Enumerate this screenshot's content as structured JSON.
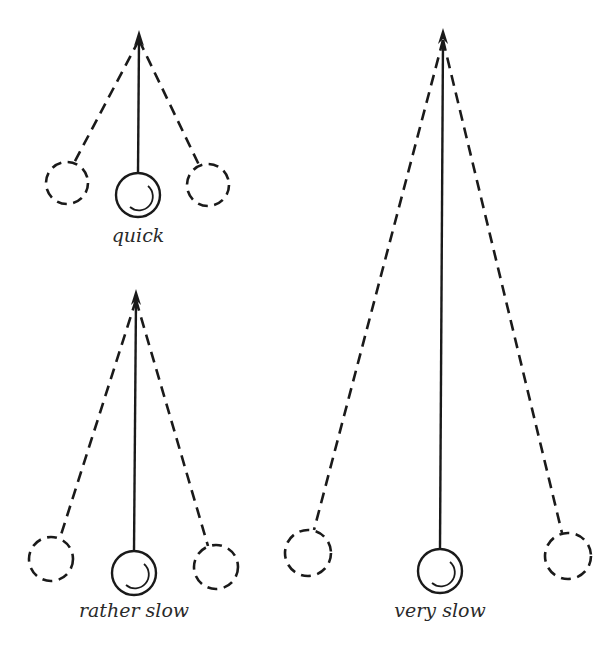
{
  "figure": {
    "pendulums": [
      {
        "id": "quick",
        "label": "quick",
        "pivot": [
          139,
          32
        ],
        "bob": [
          138,
          195
        ],
        "left": [
          67,
          183
        ],
        "right": [
          208,
          185
        ],
        "radius": 21
      },
      {
        "id": "rather-slow",
        "label": "rather slow",
        "pivot": [
          136,
          291
        ],
        "bob": [
          134,
          573
        ],
        "left": [
          51,
          559
        ],
        "right": [
          216,
          567
        ],
        "radius": 22
      },
      {
        "id": "very-slow",
        "label": "very slow",
        "pivot": [
          443,
          30
        ],
        "bob": [
          440,
          571
        ],
        "left": [
          308,
          553
        ],
        "right": [
          568,
          556
        ],
        "radius": 22
      }
    ]
  },
  "labels": {
    "quick": "quick",
    "rather_slow": "rather slow",
    "very_slow": "very slow"
  },
  "colors": {
    "ink": "#1a1a1a",
    "background": "#ffffff"
  }
}
